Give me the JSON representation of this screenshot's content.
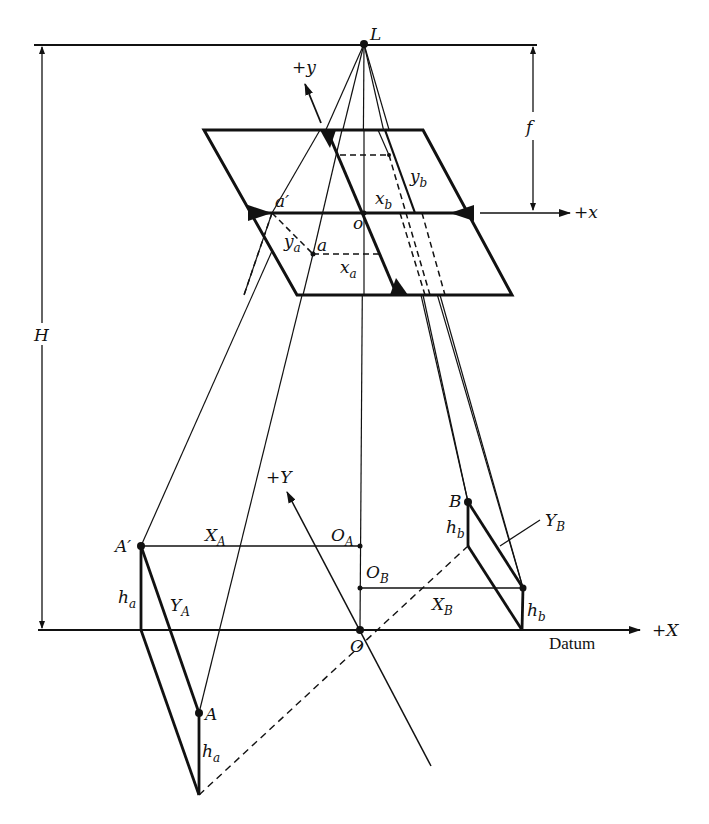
{
  "figure": {
    "colors": {
      "ink": "#111111",
      "background": "#ffffff"
    }
  },
  "labels": {
    "L": "L",
    "f": "f",
    "H": "H",
    "plus_y": "+y",
    "plus_x": "+x",
    "o": "o",
    "a_prime": "a′",
    "a": "a",
    "y_a_main": "y",
    "y_a_sub": "a",
    "x_a_main": "x",
    "x_a_sub": "a",
    "x_b_main": "x",
    "x_b_sub": "b",
    "y_b_main": "y",
    "y_b_sub": "b",
    "plus_Y": "+Y",
    "A_prime": "A′",
    "X_A_main": "X",
    "X_A_sub": "A",
    "O_A_main": "O",
    "O_A_sub": "A",
    "O_B_main": "O",
    "O_B_sub": "B",
    "B": "B",
    "h_b_upper_main": "h",
    "h_b_upper_sub": "b",
    "Y_B_main": "Y",
    "Y_B_sub": "B",
    "h_a_left_main": "h",
    "h_a_left_sub": "a",
    "Y_A_main": "Y",
    "Y_A_sub": "A",
    "X_B_main": "X",
    "X_B_sub": "B",
    "h_b_lower_main": "h",
    "h_b_lower_sub": "b",
    "O": "O",
    "datum": "Datum",
    "plus_X": "+X",
    "A": "A",
    "h_a_lower_main": "h",
    "h_a_lower_sub": "a"
  },
  "points": {
    "L": [
      364,
      44
    ],
    "o": [
      364,
      213
    ],
    "a": [
      313,
      254
    ],
    "b": [
      389,
      155
    ],
    "A_prime": [
      141,
      546
    ],
    "A": [
      199,
      713
    ],
    "O_A": [
      360,
      546
    ],
    "O_B": [
      360,
      588
    ],
    "O": [
      360,
      630
    ],
    "B": [
      468,
      502
    ],
    "B_prime": [
      523,
      588
    ]
  }
}
